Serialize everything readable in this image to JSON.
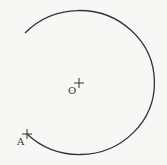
{
  "diagram": {
    "type": "geometry-arc",
    "center": {
      "label": "O",
      "x": 79,
      "y": 83
    },
    "arc": {
      "rx": 75,
      "ry": 72,
      "start": {
        "x": 25,
        "y": 33
      },
      "end": {
        "x": 27,
        "y": 134
      },
      "stroke": "#333333"
    },
    "points": [
      {
        "label": "A",
        "x": 27,
        "y": 134
      },
      {
        "label": "O",
        "x": 79,
        "y": 83
      }
    ]
  },
  "labels": {
    "center": "O",
    "point_a": "A"
  }
}
